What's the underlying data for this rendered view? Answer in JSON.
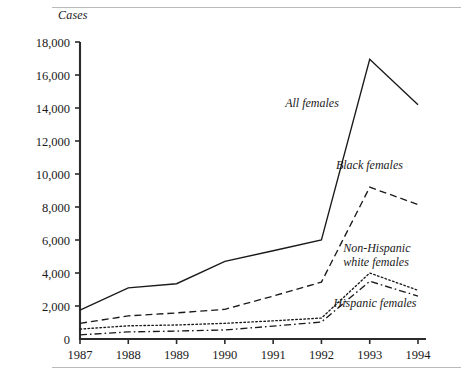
{
  "figure": {
    "y_axis_title": "Cases",
    "decorative_rules": 2
  },
  "chart_data": {
    "type": "line",
    "title": "",
    "subtitle": "",
    "xlabel": "",
    "ylabel": "Cases",
    "x": [
      1987,
      1988,
      1989,
      1990,
      1991,
      1992,
      1993,
      1994
    ],
    "categories": [
      "1987",
      "1988",
      "1989",
      "1990",
      "1991",
      "1992",
      "1993",
      "1994"
    ],
    "xtick_labels": [
      "1987",
      "1988",
      "1989",
      "1990",
      "1991",
      "1992",
      "1993",
      "1994"
    ],
    "ytick_labels": [
      "0",
      "2,000",
      "4,000",
      "6,000",
      "8,000",
      "10,000",
      "12,000",
      "14,000",
      "16,000",
      "18,000"
    ],
    "ytick_values": [
      0,
      2000,
      4000,
      6000,
      8000,
      10000,
      12000,
      14000,
      16000,
      18000
    ],
    "ylim": [
      0,
      18000
    ],
    "xlim": [
      1987,
      1994
    ],
    "grid": false,
    "legend_position": "inline-annotations",
    "series": [
      {
        "name": "All females",
        "style": "solid",
        "label": "All females",
        "label_x": 1991.25,
        "label_y": 14050,
        "values": [
          1750,
          3100,
          3350,
          4700,
          5350,
          6000,
          16950,
          14200
        ]
      },
      {
        "name": "Black females",
        "style": "dashed",
        "label": "Black females",
        "label_x": 1992.3,
        "label_y": 10300,
        "values": [
          950,
          1400,
          1580,
          1800,
          2600,
          3450,
          9200,
          8150
        ]
      },
      {
        "name": "Non-Hispanic white females",
        "style": "dotted",
        "label": "Non-Hispanic white females",
        "label_line_1": "Non-Hispanic",
        "label_line_2": "white females",
        "label_x": 1992.45,
        "label_y": 5300,
        "values": [
          600,
          800,
          850,
          950,
          1100,
          1270,
          4000,
          2950
        ]
      },
      {
        "name": "Hispanic females",
        "style": "dashdot",
        "label": "Hispanic females",
        "label_x": 1992.25,
        "label_y": 1950,
        "values": [
          250,
          430,
          480,
          550,
          780,
          1030,
          3500,
          2600
        ]
      }
    ]
  }
}
